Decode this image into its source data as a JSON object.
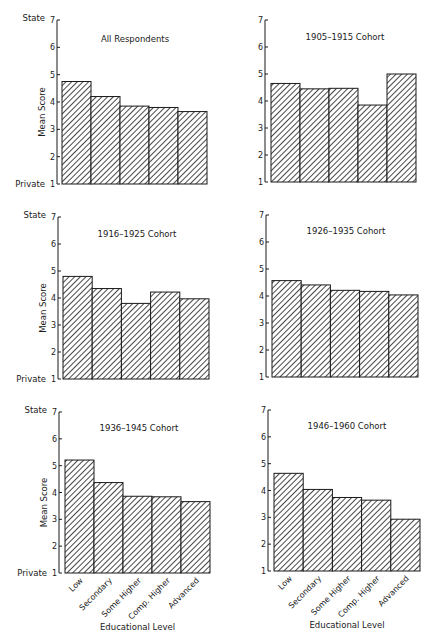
{
  "chart_data": [
    {
      "type": "bar",
      "title": "All Respondents",
      "categories": [
        "Low",
        "Secondary",
        "Some Higher",
        "Comp. Higher",
        "Advanced"
      ],
      "values": [
        4.75,
        4.2,
        3.85,
        3.8,
        3.65
      ],
      "xlabel": "",
      "ylabel": "Mean Score",
      "ylim": [
        1,
        7
      ],
      "yticks": [
        1,
        2,
        3,
        4,
        5,
        6,
        7
      ],
      "y_top_label": "State",
      "y_bottom_label": "Private",
      "hatch": "diagonal"
    },
    {
      "type": "bar",
      "title": "1905–1915 Cohort",
      "categories": [
        "Low",
        "Secondary",
        "Some Higher",
        "Comp. Higher",
        "Advanced"
      ],
      "values": [
        4.65,
        4.45,
        4.47,
        3.85,
        5.0
      ],
      "xlabel": "",
      "ylabel": "",
      "ylim": [
        1,
        7
      ],
      "yticks": [
        1,
        2,
        3,
        4,
        5,
        6,
        7
      ],
      "hatch": "diagonal"
    },
    {
      "type": "bar",
      "title": "1916–1925 Cohort",
      "categories": [
        "Low",
        "Secondary",
        "Some Higher",
        "Comp. Higher",
        "Advanced"
      ],
      "values": [
        4.8,
        4.35,
        3.8,
        4.22,
        3.97
      ],
      "xlabel": "",
      "ylabel": "Mean Score",
      "ylim": [
        1,
        7
      ],
      "yticks": [
        1,
        2,
        3,
        4,
        5,
        6,
        7
      ],
      "y_top_label": "State",
      "y_bottom_label": "Private",
      "hatch": "diagonal"
    },
    {
      "type": "bar",
      "title": "1926–1935 Cohort",
      "categories": [
        "Low",
        "Secondary",
        "Some Higher",
        "Comp. Higher",
        "Advanced"
      ],
      "values": [
        4.57,
        4.41,
        4.21,
        4.17,
        4.04
      ],
      "xlabel": "",
      "ylabel": "",
      "ylim": [
        1,
        7
      ],
      "yticks": [
        1,
        2,
        3,
        4,
        5,
        6,
        7
      ],
      "hatch": "diagonal"
    },
    {
      "type": "bar",
      "title": "1936–1945 Cohort",
      "categories": [
        "Low",
        "Secondary",
        "Some Higher",
        "Comp. Higher",
        "Advanced"
      ],
      "values": [
        5.21,
        4.37,
        3.86,
        3.84,
        3.66
      ],
      "xlabel": "Educational Level",
      "ylabel": "Mean Score",
      "ylim": [
        1,
        7
      ],
      "yticks": [
        1,
        2,
        3,
        4,
        5,
        6,
        7
      ],
      "y_top_label": "State",
      "y_bottom_label": "Private",
      "hatch": "diagonal"
    },
    {
      "type": "bar",
      "title": "1946–1960 Cohort",
      "categories": [
        "Low",
        "Secondary",
        "Some Higher",
        "Comp. Higher",
        "Advanced"
      ],
      "values": [
        4.64,
        4.04,
        3.74,
        3.64,
        2.93
      ],
      "xlabel": "Educational Level",
      "ylabel": "",
      "ylim": [
        1,
        7
      ],
      "yticks": [
        1,
        2,
        3,
        4,
        5,
        6,
        7
      ],
      "hatch": "diagonal"
    }
  ],
  "layout": {
    "panels": [
      {
        "axis_x": 57,
        "bar_x0": 62,
        "bar_x1": 207,
        "y_top": 20,
        "y_bottom": 184,
        "title_x": 135,
        "title_y": 42
      },
      {
        "axis_x": 265,
        "bar_x0": 271,
        "bar_x1": 416,
        "y_top": 20,
        "y_bottom": 182,
        "title_x": 345,
        "title_y": 40
      },
      {
        "axis_x": 58,
        "bar_x0": 63,
        "bar_x1": 209,
        "y_top": 217,
        "y_bottom": 379,
        "title_x": 137,
        "title_y": 237
      },
      {
        "axis_x": 266,
        "bar_x0": 272,
        "bar_x1": 418,
        "y_top": 215,
        "y_bottom": 377,
        "title_x": 346,
        "title_y": 234
      },
      {
        "axis_x": 59,
        "bar_x0": 65,
        "bar_x1": 210,
        "y_top": 412,
        "y_bottom": 573,
        "title_x": 139,
        "title_y": 431
      },
      {
        "axis_x": 268,
        "bar_x0": 274,
        "bar_x1": 420,
        "y_top": 410,
        "y_bottom": 571,
        "title_x": 347,
        "title_y": 429
      }
    ],
    "colors": {
      "ink": "#1a1a1a",
      "background": "#ffffff"
    }
  }
}
